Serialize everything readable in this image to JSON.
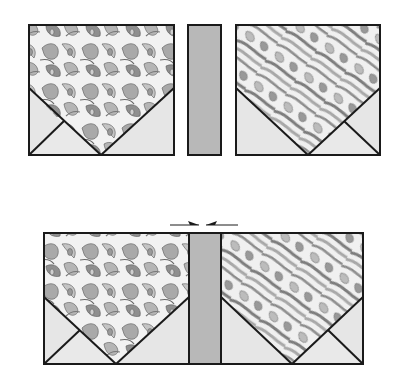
{
  "diagram": {
    "colors": {
      "outline": "#1a1a1a",
      "print_light": "#f2f2f2",
      "print_mid": "#bdbdbd",
      "print_dark": "#8a8a8a",
      "triangle_fill": "#e6e6e6",
      "strip_fill": "#b8b8b8"
    },
    "top_row": {
      "left_panel": {
        "x": 29,
        "y": 25,
        "w": 145,
        "h": 130
      },
      "strip": {
        "x": 188,
        "y": 25,
        "w": 33,
        "h": 130
      },
      "right_panel": {
        "x": 236,
        "y": 25,
        "w": 144,
        "h": 130
      }
    },
    "bottom_row": {
      "assembled": {
        "x": 44,
        "y": 233,
        "w": 319,
        "h": 131
      },
      "strip": {
        "x": 189,
        "w": 32
      },
      "join_arrows": {
        "y": 225,
        "left": [
          170,
          199
        ],
        "right": [
          206,
          238
        ]
      }
    }
  }
}
